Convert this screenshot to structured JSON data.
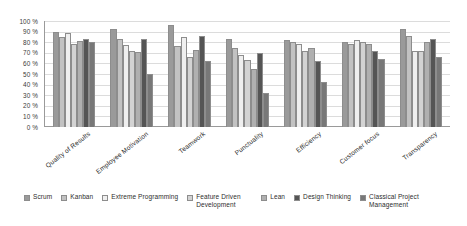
{
  "chart_data": {
    "type": "bar",
    "title": "",
    "xlabel": "",
    "ylabel": "",
    "ylim": [
      0,
      100
    ],
    "ytick_labels": [
      "100 %",
      "90 %",
      "80 %",
      "70 %",
      "60 %",
      "50 %",
      "40 %",
      "30 %",
      "20 %",
      "10 %",
      "0 %"
    ],
    "ytick_values": [
      100,
      90,
      80,
      70,
      60,
      50,
      40,
      30,
      20,
      10,
      0
    ],
    "grid": true,
    "legend_position": "bottom",
    "categories": [
      "Quality of Results",
      "Employee Motivation",
      "Teamwork",
      "Punctuality",
      "Efficiency",
      "Customer focus",
      "Transparency"
    ],
    "series": [
      {
        "name": "Scrum",
        "color": "#9a9a9a",
        "values": [
          90,
          92,
          96,
          83,
          82,
          80,
          92
        ]
      },
      {
        "name": "Kanban",
        "color": "#c2c2c2",
        "values": [
          85,
          83,
          76,
          75,
          80,
          78,
          86
        ]
      },
      {
        "name": "Extreme Programming",
        "color": "#efefef",
        "values": [
          89,
          77,
          85,
          68,
          78,
          82,
          72
        ]
      },
      {
        "name": "Feature Driven Development",
        "color": "#d3d3d3",
        "values": [
          78,
          72,
          66,
          63,
          72,
          80,
          72
        ]
      },
      {
        "name": "Lean",
        "color": "#b0b0b0",
        "values": [
          81,
          71,
          73,
          55,
          75,
          78,
          80
        ]
      },
      {
        "name": "Design Thinking",
        "color": "#555555",
        "values": [
          83,
          83,
          86,
          70,
          62,
          72,
          83
        ]
      },
      {
        "name": "Classical Project Management",
        "color": "#787878",
        "values": [
          80,
          50,
          62,
          32,
          42,
          64,
          66
        ]
      }
    ]
  },
  "legend": {
    "items": [
      {
        "label": "Scrum"
      },
      {
        "label": "Kanban"
      },
      {
        "label": "Extreme Programming"
      },
      {
        "label": "Feature Driven Development"
      },
      {
        "label": "Lean"
      },
      {
        "label": "Design Thinking"
      },
      {
        "label": "Classical Project Management"
      }
    ]
  }
}
